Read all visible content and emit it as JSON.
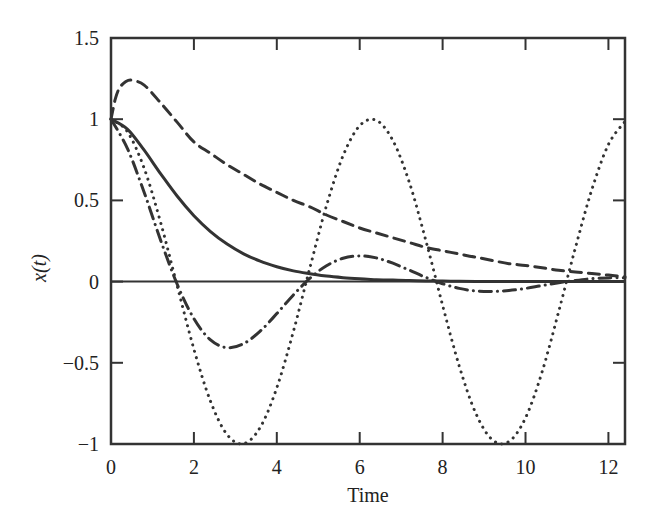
{
  "chart_data": {
    "type": "line",
    "title": "",
    "xlabel": "Time",
    "ylabel": "x(t)",
    "xlim": [
      0,
      12.4
    ],
    "ylim": [
      -1,
      1.5
    ],
    "grid": false,
    "legend": null,
    "x_ticks": [
      0,
      2,
      4,
      6,
      8,
      10,
      12
    ],
    "x_tick_labels": [
      "0",
      "2",
      "4",
      "6",
      "8",
      "10",
      "12"
    ],
    "y_ticks": [
      1.5,
      1,
      0.5,
      0,
      -0.5,
      -1
    ],
    "y_tick_labels": [
      "1.5",
      "1",
      "0.5",
      "0",
      "−0.5",
      "−1"
    ],
    "zero_line": true,
    "series": [
      {
        "name": "undamped (dotted)",
        "style": "dotted",
        "color": "#333333",
        "x": [
          0,
          0.4,
          0.8,
          1.2,
          1.6,
          2.0,
          2.4,
          2.8,
          3.2,
          3.6,
          4.0,
          4.4,
          4.8,
          5.2,
          5.6,
          6.0,
          6.4,
          6.8,
          7.2,
          7.6,
          8.0,
          8.4,
          8.8,
          9.2,
          9.6,
          10.0,
          10.4,
          10.8,
          11.2,
          11.6,
          12.0,
          12.4
        ],
        "values": [
          1,
          0.921,
          0.697,
          0.362,
          -0.029,
          -0.416,
          -0.737,
          -0.942,
          -0.998,
          -0.897,
          -0.654,
          -0.307,
          0.087,
          0.468,
          0.776,
          0.96,
          0.993,
          0.869,
          0.608,
          0.249,
          -0.146,
          -0.519,
          -0.811,
          -0.974,
          -0.985,
          -0.839,
          -0.556,
          -0.185,
          0.205,
          0.566,
          0.844,
          0.986
        ]
      },
      {
        "name": "underdamped (dash-dot)",
        "style": "dashdot",
        "color": "#333333",
        "x": [
          0,
          0.4,
          0.8,
          1.2,
          1.6,
          2.0,
          2.4,
          2.8,
          3.2,
          3.6,
          4.0,
          4.4,
          4.8,
          5.2,
          5.6,
          6.0,
          6.4,
          6.8,
          7.2,
          7.6,
          8.0,
          8.4,
          8.8,
          9.2,
          9.6,
          10.0,
          10.4,
          10.8,
          11.2,
          11.6,
          12.0,
          12.4
        ],
        "values": [
          1,
          0.817,
          0.549,
          0.253,
          -0.018,
          -0.228,
          -0.359,
          -0.407,
          -0.382,
          -0.305,
          -0.197,
          -0.082,
          0.021,
          0.098,
          0.144,
          0.158,
          0.146,
          0.113,
          0.07,
          0.025,
          -0.013,
          -0.042,
          -0.058,
          -0.061,
          -0.055,
          -0.042,
          -0.024,
          -0.007,
          0.007,
          0.018,
          0.023,
          0.024
        ]
      },
      {
        "name": "critically damped (solid)",
        "style": "solid",
        "color": "#333333",
        "x": [
          0,
          0.4,
          0.8,
          1.2,
          1.6,
          2.0,
          2.4,
          2.8,
          3.2,
          3.6,
          4.0,
          4.4,
          4.8,
          5.2,
          5.6,
          6.0,
          6.4,
          6.8,
          7.2,
          7.6,
          8.0,
          8.4,
          8.8,
          9.2,
          9.6,
          10.0,
          10.4,
          10.8,
          11.2,
          11.6,
          12.0,
          12.4
        ],
        "values": [
          1,
          0.938,
          0.809,
          0.663,
          0.525,
          0.406,
          0.308,
          0.231,
          0.171,
          0.126,
          0.092,
          0.066,
          0.048,
          0.034,
          0.024,
          0.017,
          0.012,
          0.009,
          0.006,
          0.004,
          0.003,
          0.002,
          0.001,
          0.001,
          0.001,
          0,
          0,
          0,
          0,
          0,
          0,
          0
        ]
      },
      {
        "name": "overdamped (dashed)",
        "style": "dashed",
        "color": "#333333",
        "x": [
          0,
          0.1,
          0.2,
          0.35,
          0.5,
          0.8,
          1.2,
          1.6,
          2.0,
          2.4,
          2.8,
          3.2,
          3.6,
          4.0,
          4.4,
          4.8,
          5.2,
          5.6,
          6.0,
          6.4,
          6.8,
          7.2,
          7.6,
          8.0,
          8.4,
          8.8,
          9.2,
          9.6,
          10.0,
          10.4,
          10.8,
          11.2,
          11.6,
          12.0,
          12.4
        ],
        "values": [
          1,
          1.12,
          1.19,
          1.23,
          1.24,
          1.21,
          1.1,
          0.98,
          0.86,
          0.79,
          0.72,
          0.66,
          0.6,
          0.55,
          0.5,
          0.46,
          0.41,
          0.37,
          0.33,
          0.3,
          0.27,
          0.24,
          0.21,
          0.19,
          0.17,
          0.15,
          0.13,
          0.11,
          0.1,
          0.085,
          0.07,
          0.06,
          0.05,
          0.04,
          0.03
        ]
      }
    ]
  }
}
